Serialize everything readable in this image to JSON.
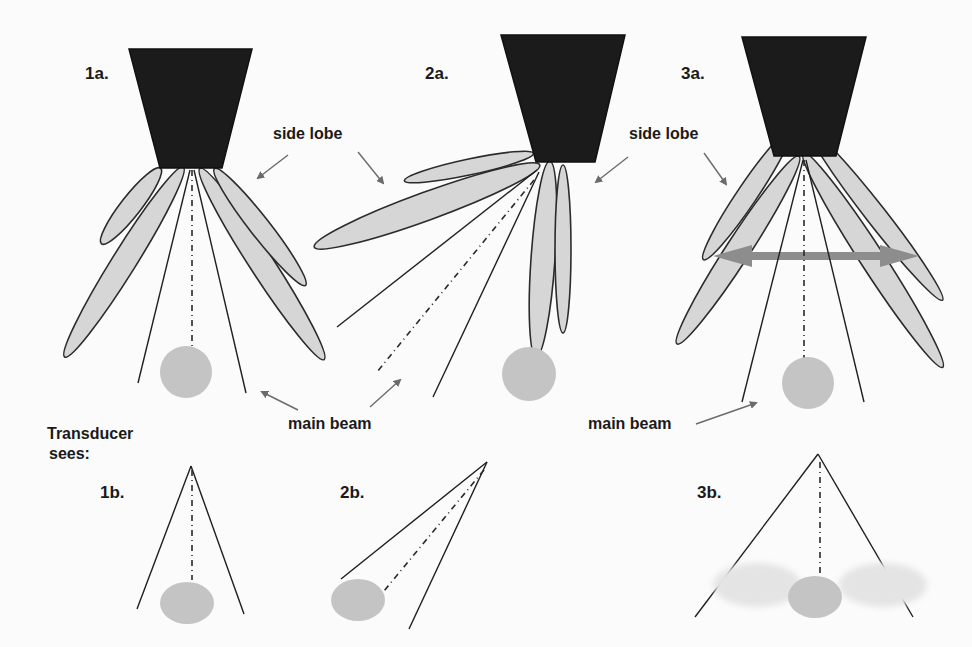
{
  "figure": {
    "type": "diagram",
    "background": "#fbfbfb",
    "colors": {
      "transducer": "#1b1b1b",
      "lobe_fill": "#d6d6d6",
      "target_fill": "#c4c4c4",
      "ghost_fill": "#e4e4e4",
      "pointer": "#6b6b6b",
      "sweep_arrow": "#8d8d8d"
    }
  },
  "panels": {
    "p1a": {
      "label": "1a."
    },
    "p2a": {
      "label": "2a."
    },
    "p3a": {
      "label": "3a."
    },
    "p1b": {
      "label": "1b."
    },
    "p2b": {
      "label": "2b."
    },
    "p3b": {
      "label": "3b."
    }
  },
  "annotations": {
    "side_lobe_1": "side lobe",
    "side_lobe_2": "side lobe",
    "main_beam_1": "main beam",
    "main_beam_2": "main beam",
    "transducer_sees_line1": "Transducer",
    "transducer_sees_line2": "sees:"
  }
}
